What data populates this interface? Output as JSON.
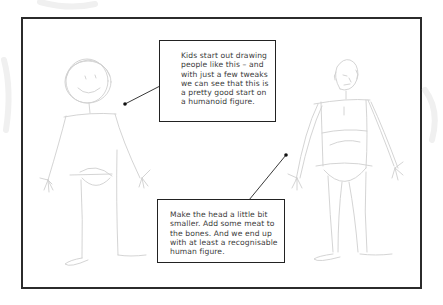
{
  "diagram": {
    "frame": {
      "border_color": "#2b2b2b",
      "background": "#ffffff"
    },
    "sketch_color": "#c8c8c8",
    "figures": [
      {
        "id": "stick-figure",
        "description": "Child-style stick figure with round head and smile"
      },
      {
        "id": "humanoid-figure",
        "description": "Refined figure with smaller head and fleshed-out body"
      }
    ],
    "callouts": [
      {
        "id": "callout-stick",
        "text": "Kids start out drawing people like this – and with just a few tweaks we can see that this is a pretty good start on a humanoid figure.",
        "lines": [
          "Kids start out drawing",
          "people like this – and",
          "with just a few tweaks",
          "we can see that this is",
          "a pretty good start on",
          "a humanoid figure."
        ]
      },
      {
        "id": "callout-humanoid",
        "text": "Make the head a little bit smaller. Add some meat to the bones. And we end up with at least a recognisable human figure.",
        "lines": [
          "Make the head a little bit",
          "smaller. Add some meat to",
          "the bones. And we end up",
          "with at least a recognisable",
          "human figure."
        ]
      }
    ]
  }
}
